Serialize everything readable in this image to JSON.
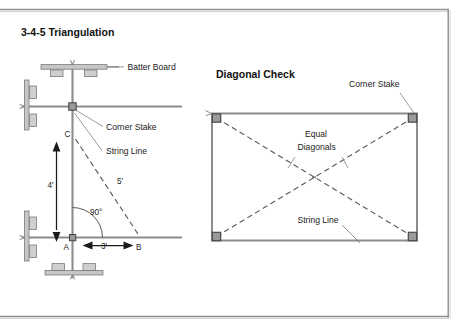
{
  "page": {
    "width": 468,
    "height": 330,
    "background": "#ffffff",
    "frame_color": "#8a8a8a"
  },
  "colors": {
    "line": "#6e6e6e",
    "dark_line": "#4a4a4a",
    "text": "#1a1a1a",
    "stake_fill": "#9a9a9a",
    "board_fill": "#c8c8c8",
    "board_stroke": "#7a7a7a",
    "dashed": "#5a5a5a"
  },
  "left_panel": {
    "title": "3-4-5 Triangulation",
    "labels": {
      "batter_board": "Batter Board",
      "corner_stake": "Corner Stake",
      "string_line": "String Line"
    },
    "triangle": {
      "vertex_a": "A",
      "vertex_b": "B",
      "vertex_c": "C",
      "leg_vertical": "4'",
      "leg_horizontal": "3'",
      "hypotenuse": "5'",
      "angle": "90°"
    }
  },
  "right_panel": {
    "title": "Diagonal Check",
    "labels": {
      "corner_stake": "Corner Stake",
      "equal_diagonals_line1": "Equal",
      "equal_diagonals_line2": "Diagonals",
      "string_line": "String Line"
    }
  }
}
